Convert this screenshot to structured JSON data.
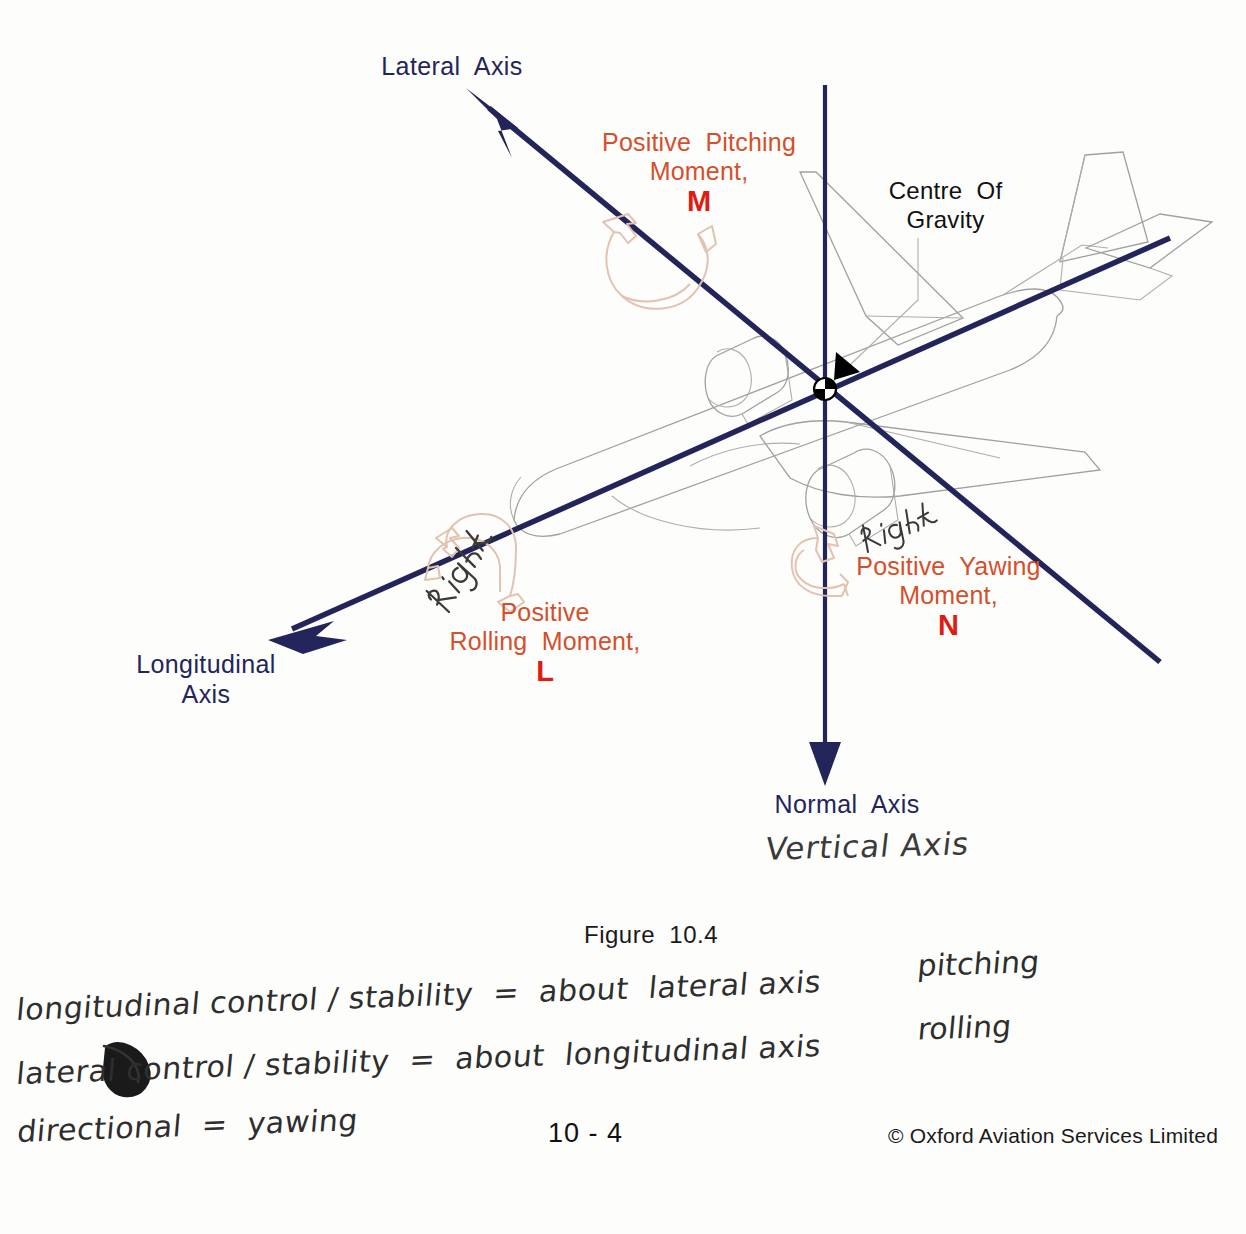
{
  "figure": {
    "caption": "Figure  10.4",
    "page_number": "10 - 4",
    "copyright": "© Oxford Aviation Services Limited"
  },
  "colors": {
    "axis": "#23255a",
    "moment_text": "#d4502c",
    "moment_symbol": "#e11b11",
    "aircraft_outline": "#9a9a9a",
    "curved_arrow": "#e0bfae",
    "cg_marker": "#000000",
    "handwriting": "#2a2a2a",
    "background": "#fdfdfc"
  },
  "axes": [
    {
      "id": "lateral",
      "label": "Lateral Axis",
      "label_lines": [
        "Lateral  Axis"
      ],
      "arrow": "up-left"
    },
    {
      "id": "longitudinal",
      "label": "Longitudinal Axis",
      "label_lines": [
        "Longitudinal",
        "Axis"
      ],
      "arrow": "down-left"
    },
    {
      "id": "normal",
      "label": "Normal Axis",
      "label_lines": [
        "Normal  Axis"
      ],
      "arrow": "down"
    }
  ],
  "cg": {
    "label_lines": [
      "Centre  Of",
      "Gravity"
    ]
  },
  "moments": [
    {
      "id": "pitching",
      "label_lines": [
        "Positive  Pitching",
        "Moment,"
      ],
      "symbol": "M",
      "axis": "lateral"
    },
    {
      "id": "rolling",
      "label_lines": [
        "Positive",
        "Rolling  Moment,"
      ],
      "symbol": "L",
      "axis": "longitudinal"
    },
    {
      "id": "yawing",
      "label_lines": [
        "Positive  Yawing",
        "Moment,"
      ],
      "symbol": "N",
      "axis": "normal"
    }
  ],
  "handwriting": {
    "vertical_axis": "Vertical Axis",
    "right_roll": "Right",
    "right_yaw": "Right",
    "notes": [
      "longitudinal control / stability  =  about  lateral axis",
      "lateral control / stability  =  about  longitudinal axis",
      "directional  =  yawing"
    ],
    "note_right_column": [
      "pitching",
      "rolling"
    ]
  }
}
